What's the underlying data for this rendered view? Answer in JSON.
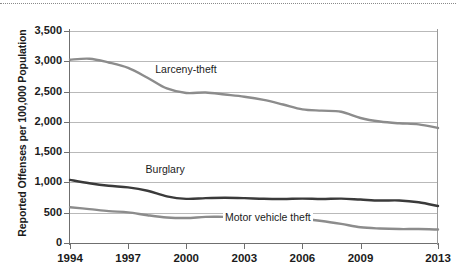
{
  "chart_data": {
    "type": "line",
    "title": "",
    "subtitle": "",
    "xlabel": "",
    "ylabel": "Reported Offenses per 100,000 Population",
    "xlim": [
      1994,
      2013
    ],
    "ylim": [
      0,
      3500
    ],
    "grid": true,
    "legend_position": "inline-annotations",
    "x": [
      1994,
      1995,
      1996,
      1997,
      1998,
      1999,
      2000,
      2001,
      2002,
      2003,
      2004,
      2005,
      2006,
      2007,
      2008,
      2009,
      2010,
      2011,
      2012,
      2013
    ],
    "xtick_labels": [
      "1994",
      "1997",
      "2000",
      "2003",
      "2006",
      "2009",
      "2013"
    ],
    "xticks": [
      1994,
      1997,
      2000,
      2003,
      2006,
      2009,
      2013
    ],
    "ytick_labels": [
      "0",
      "500",
      "1,000",
      "1,500",
      "2,000",
      "2,500",
      "3,000",
      "3,500"
    ],
    "yticks": [
      0,
      500,
      1000,
      1500,
      2000,
      2500,
      3000,
      3500
    ],
    "series": [
      {
        "name": "Larceny-theft",
        "color": "#8c8c8c",
        "values": [
          3026,
          3043,
          2980,
          2891,
          2729,
          2551,
          2477,
          2485,
          2451,
          2415,
          2362,
          2287,
          2207,
          2185,
          2167,
          2064,
          2005,
          1976,
          1959,
          1899
        ]
      },
      {
        "name": "Burglary",
        "color": "#3a3a3a",
        "values": [
          1042,
          987,
          945,
          919,
          863,
          770,
          729,
          741,
          747,
          741,
          730,
          727,
          733,
          726,
          733,
          717,
          701,
          702,
          672,
          610
        ]
      },
      {
        "name": "Motor vehicle theft",
        "color": "#8c8c8c",
        "values": [
          591,
          560,
          526,
          506,
          459,
          422,
          412,
          431,
          432,
          433,
          422,
          417,
          400,
          364,
          315,
          259,
          239,
          230,
          230,
          222
        ]
      }
    ],
    "annotations": [
      {
        "text": "Larceny-theft",
        "x": 1998.3,
        "y": 2880
      },
      {
        "text": "Burglary",
        "x": 1997.8,
        "y": 1215
      },
      {
        "text": "Motor vehicle theft",
        "x": 2001.9,
        "y": 430
      }
    ]
  },
  "axes": {
    "y_title": "Reported Offenses per 100,000 Population"
  },
  "colors": {
    "larceny": "#8c8c8c",
    "burglary": "#3a3a3a",
    "motor_vehicle": "#8c8c8c",
    "gridline": "#b9b9b9",
    "axis": "#6f6f6f",
    "text": "#1b1b1b",
    "background": "#ffffff"
  }
}
